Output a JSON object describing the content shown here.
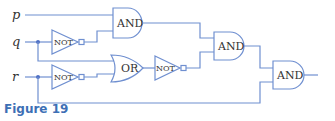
{
  "figure": {
    "caption": "Figure 19",
    "colors": {
      "wire": "#6f8fd0",
      "caption": "#3d6fb5",
      "text": "#333333"
    }
  },
  "inputs": [
    {
      "name": "p"
    },
    {
      "name": "q"
    },
    {
      "name": "r"
    }
  ],
  "gates": {
    "not_q": {
      "type": "NOT",
      "label": "NOT"
    },
    "not_r": {
      "type": "NOT",
      "label": "NOT"
    },
    "and_1": {
      "type": "AND",
      "label": "AND"
    },
    "or_1": {
      "type": "OR",
      "label": "OR"
    },
    "not_or": {
      "type": "NOT",
      "label": "NOT"
    },
    "and_2": {
      "type": "AND",
      "label": "AND"
    },
    "and_3": {
      "type": "AND",
      "label": "AND"
    }
  }
}
